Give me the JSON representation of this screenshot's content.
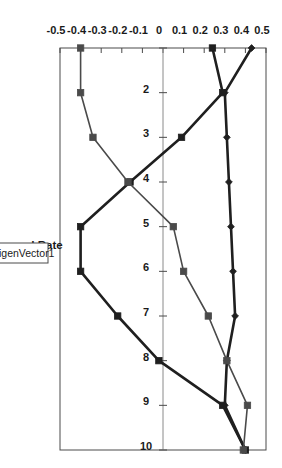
{
  "chart_data": {
    "type": "line",
    "title": "",
    "xlabel": "Forward Rate",
    "ylabel": "",
    "x": [
      1,
      2,
      3,
      4,
      5,
      6,
      7,
      8,
      9,
      10
    ],
    "xlim": [
      1,
      10
    ],
    "ylim": [
      -0.5,
      0.5
    ],
    "x_ticks": [
      "1",
      "2",
      "3",
      "4",
      "5",
      "6",
      "7",
      "8",
      "9",
      "10"
    ],
    "x_tick_labels_shown": [
      "2",
      "3",
      "4",
      "5",
      "6",
      "7",
      "8",
      "9",
      "10"
    ],
    "y_ticks": [
      0.5,
      0.4,
      0.3,
      0.2,
      0.1,
      0,
      -0.1,
      -0.2,
      -0.3,
      -0.4,
      -0.5
    ],
    "y_tick_labels": [
      "0.5",
      "0.4",
      "0.3",
      "0.2",
      "0.1",
      "0",
      "-0.1",
      "-0.2",
      "-0.3",
      "-0.4",
      "-0.5"
    ],
    "grid": false,
    "legend_position": "bottom",
    "legend": [
      "EigenVector1"
    ],
    "series": [
      {
        "name": "EigenVector1",
        "marker": "diamond",
        "color": "#1f1f1f",
        "width": 2.6,
        "values": [
          0.43,
          0.3,
          0.31,
          0.32,
          0.33,
          0.34,
          0.35,
          0.31,
          0.3,
          0.4
        ]
      },
      {
        "name": "EigenVector2",
        "marker": "square",
        "color": "#1f1f1f",
        "width": 2.6,
        "values": [
          0.24,
          0.29,
          0.09,
          -0.16,
          -0.4,
          -0.4,
          -0.22,
          -0.02,
          0.29,
          0.4
        ]
      },
      {
        "name": "EigenVector3",
        "marker": "square",
        "color": "#4a4a4a",
        "width": 1.6,
        "values": [
          -0.4,
          -0.4,
          -0.34,
          -0.17,
          0.05,
          0.1,
          0.22,
          0.31,
          0.41,
          0.39
        ]
      }
    ]
  },
  "axis": {
    "x_title": "Forward Rate"
  },
  "legend": {
    "entries": [
      {
        "label": "EigenVector1"
      }
    ]
  }
}
